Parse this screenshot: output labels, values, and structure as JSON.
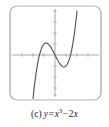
{
  "figure": {
    "label": "(c)",
    "caption_full": "(c) y = x³ − 2x",
    "equation": {
      "lhs": "y",
      "equals": "=",
      "base": "x",
      "exponent": "3",
      "minus": "−",
      "coefficient": "2",
      "variable": "x"
    }
  },
  "style": {
    "frame_color": "#b4b4b4",
    "axis_color": "#9a9a9a",
    "curve_color": "#555555",
    "tick_color": "#9a9a9a",
    "background": "#ffffff",
    "caption_color": "#1c1c1c"
  },
  "chart_data": {
    "type": "line",
    "title": "",
    "subtitle": "",
    "xlabel": "",
    "ylabel": "",
    "function": "y = x^3 - 2x",
    "xlim": [
      -4.2,
      4.2
    ],
    "ylim": [
      -4.35,
      4.35
    ],
    "grid": false,
    "legend": null,
    "axes": {
      "x_axis_visible": true,
      "y_axis_visible": true,
      "x_ticks": [
        -4,
        -3,
        -2,
        -1,
        1,
        2,
        3,
        4
      ],
      "y_ticks": [
        -4,
        -3,
        -2,
        -1,
        1,
        2,
        3,
        4
      ],
      "tick_labels_shown": false,
      "origin": [
        0,
        0
      ]
    },
    "features": {
      "roots": [
        -1.414,
        0,
        1.414
      ],
      "local_maximum": [
        -0.816,
        1.089
      ],
      "local_minimum": [
        0.816,
        -1.089
      ],
      "inflection": [
        0,
        0
      ]
    },
    "x": [
      -2.1,
      -2.0,
      -1.9,
      -1.8,
      -1.7,
      -1.6,
      -1.5,
      -1.4,
      -1.3,
      -1.2,
      -1.1,
      -1.0,
      -0.9,
      -0.8,
      -0.7,
      -0.6,
      -0.5,
      -0.4,
      -0.3,
      -0.2,
      -0.1,
      0.0,
      0.1,
      0.2,
      0.3,
      0.4,
      0.5,
      0.6,
      0.7,
      0.8,
      0.9,
      1.0,
      1.1,
      1.2,
      1.3,
      1.4,
      1.5,
      1.6,
      1.7,
      1.8,
      1.9,
      2.0,
      2.1
    ],
    "values": [
      -5.06,
      -4.0,
      -3.06,
      -2.23,
      -1.51,
      -0.9,
      -0.38,
      0.06,
      0.4,
      0.67,
      0.87,
      1.0,
      1.07,
      1.09,
      1.06,
      0.98,
      0.88,
      0.74,
      0.57,
      0.39,
      0.2,
      0.0,
      -0.2,
      -0.39,
      -0.57,
      -0.74,
      -0.88,
      -0.98,
      -1.06,
      -1.09,
      -1.07,
      -1.0,
      -0.87,
      -0.67,
      -0.4,
      -0.06,
      0.38,
      0.9,
      1.51,
      2.23,
      3.06,
      4.0,
      5.06
    ]
  }
}
